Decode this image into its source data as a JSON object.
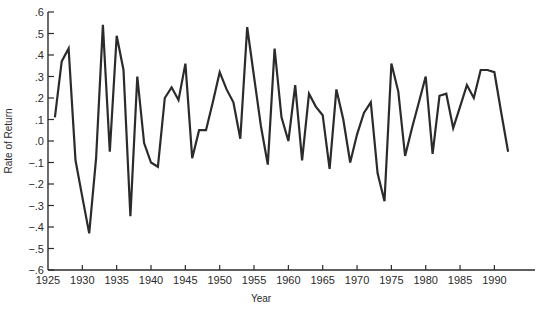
{
  "chart_data": {
    "type": "line",
    "title": "",
    "xlabel": "Year",
    "ylabel": "Rate of Return",
    "xlim": [
      1925,
      1993
    ],
    "ylim": [
      -0.6,
      0.6
    ],
    "grid": false,
    "legend": null,
    "x_ticks": [
      1925,
      1930,
      1935,
      1940,
      1945,
      1950,
      1955,
      1960,
      1965,
      1970,
      1975,
      1980,
      1985,
      1990
    ],
    "y_ticks": [
      0.6,
      0.5,
      0.4,
      0.3,
      0.2,
      0.1,
      0.0,
      -0.1,
      -0.2,
      -0.3,
      -0.4,
      -0.5,
      -0.6
    ],
    "y_tick_labels": [
      ".6",
      ".5",
      ".4",
      ".3",
      ".2",
      ".1",
      ".0",
      "−.1",
      "−.2",
      "−.3",
      "−.4",
      "−.5",
      "−.6"
    ],
    "series": [
      {
        "name": "Rate of Return",
        "x": [
          1926,
          1927,
          1928,
          1929,
          1930,
          1931,
          1932,
          1933,
          1934,
          1935,
          1936,
          1937,
          1938,
          1939,
          1940,
          1941,
          1942,
          1943,
          1944,
          1945,
          1946,
          1947,
          1948,
          1949,
          1950,
          1951,
          1952,
          1953,
          1954,
          1955,
          1956,
          1957,
          1958,
          1959,
          1960,
          1961,
          1962,
          1963,
          1964,
          1965,
          1966,
          1967,
          1968,
          1969,
          1970,
          1971,
          1972,
          1973,
          1974,
          1975,
          1976,
          1977,
          1978,
          1979,
          1980,
          1981,
          1982,
          1983,
          1984,
          1985,
          1986,
          1987,
          1988,
          1989,
          1990,
          1991,
          1992
        ],
        "values": [
          0.11,
          0.37,
          0.43,
          -0.09,
          -0.26,
          -0.43,
          -0.08,
          0.54,
          -0.05,
          0.49,
          0.33,
          -0.35,
          0.3,
          -0.01,
          -0.1,
          -0.12,
          0.2,
          0.25,
          0.19,
          0.36,
          -0.08,
          0.05,
          0.05,
          0.18,
          0.32,
          0.24,
          0.18,
          0.01,
          0.53,
          0.3,
          0.07,
          -0.11,
          0.43,
          0.11,
          0.0,
          0.26,
          -0.09,
          0.22,
          0.16,
          0.12,
          -0.13,
          0.24,
          0.1,
          -0.1,
          0.03,
          0.13,
          0.18,
          -0.15,
          -0.28,
          0.36,
          0.23,
          -0.07,
          0.06,
          0.18,
          0.3,
          -0.06,
          0.21,
          0.22,
          0.06,
          0.16,
          0.26,
          0.2,
          0.33,
          0.33,
          0.32,
          0.13,
          -0.05
        ]
      }
    ]
  },
  "colors": {
    "line": "#2b2b2b",
    "axis": "#2b2b2b",
    "text": "#2a2a2a",
    "background": "#ffffff"
  }
}
